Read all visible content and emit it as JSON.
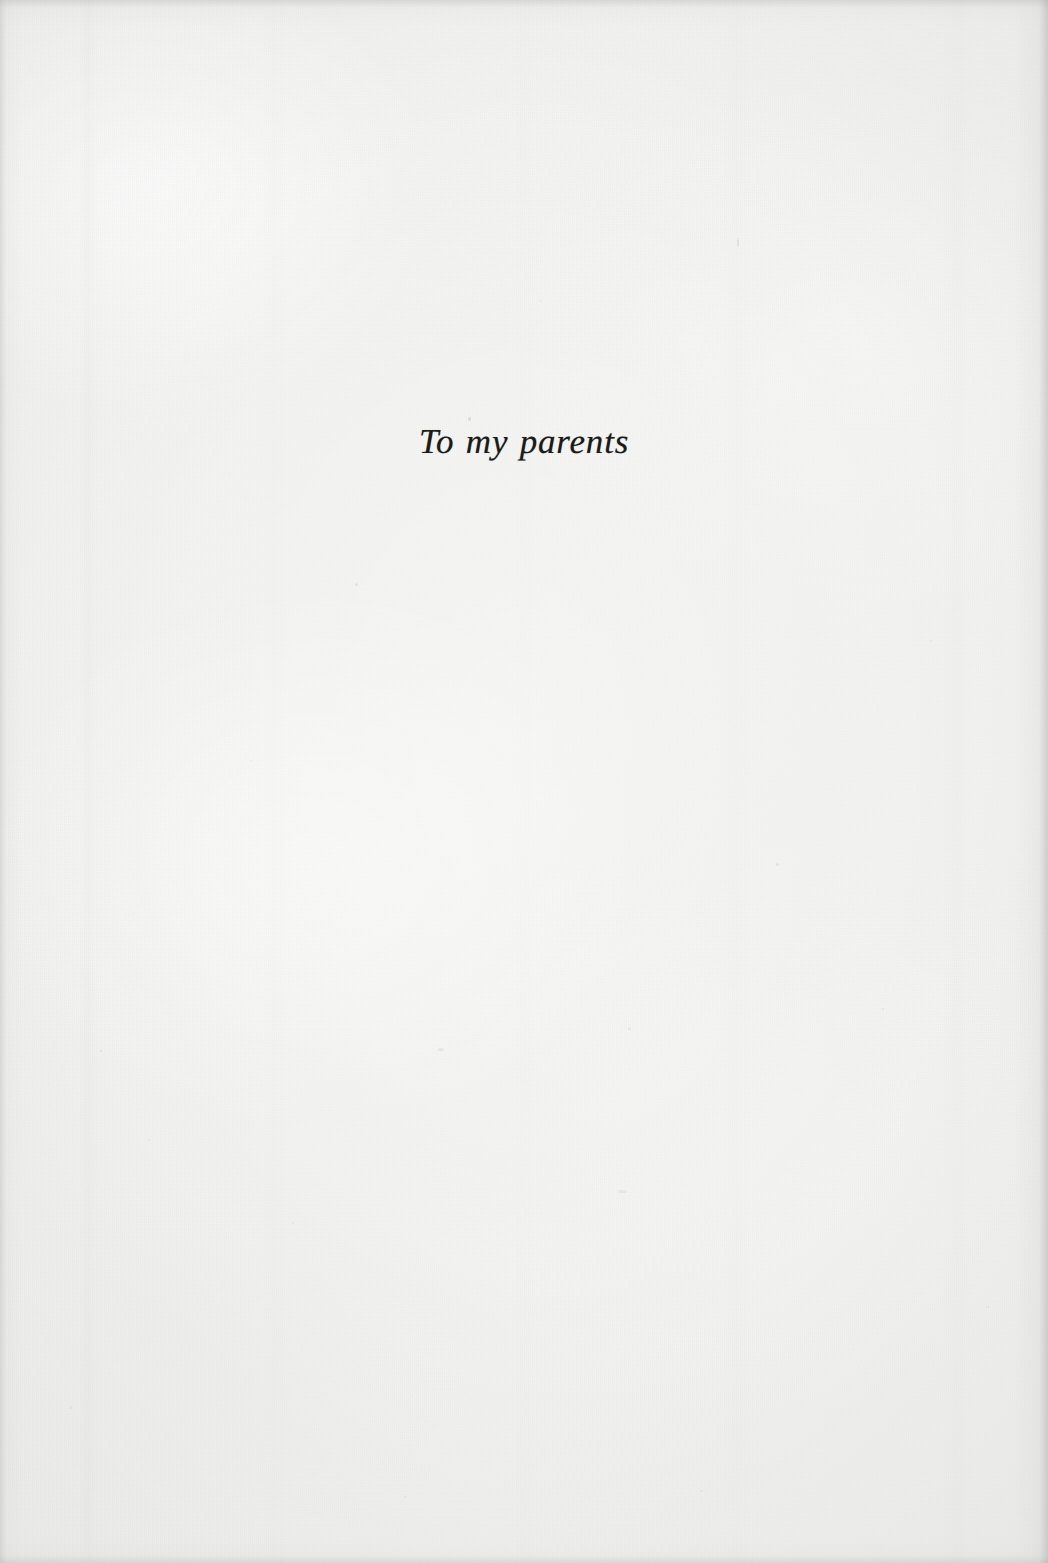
{
  "page": {
    "kind": "book-dedication-page",
    "width_px": 1048,
    "height_px": 1563,
    "paper_color": "#f3f3f1",
    "ink_color": "#1b1b19"
  },
  "dedication": {
    "text": "To my parents"
  },
  "marks": {
    "specks": [
      {
        "x": 468,
        "y": 417,
        "w": 3,
        "h": 4,
        "o": 0.42
      },
      {
        "x": 355,
        "y": 583,
        "w": 3,
        "h": 3,
        "o": 0.3
      },
      {
        "x": 737,
        "y": 238,
        "w": 2,
        "h": 9,
        "o": 0.26
      },
      {
        "x": 100,
        "y": 1050,
        "w": 2,
        "h": 2,
        "o": 0.28
      },
      {
        "x": 438,
        "y": 1048,
        "w": 6,
        "h": 3,
        "o": 0.24
      },
      {
        "x": 628,
        "y": 1028,
        "w": 3,
        "h": 2,
        "o": 0.26
      },
      {
        "x": 776,
        "y": 863,
        "w": 3,
        "h": 3,
        "o": 0.3
      },
      {
        "x": 882,
        "y": 1008,
        "w": 2,
        "h": 2,
        "o": 0.24
      },
      {
        "x": 986,
        "y": 1306,
        "w": 3,
        "h": 2,
        "o": 0.22
      },
      {
        "x": 70,
        "y": 1406,
        "w": 2,
        "h": 3,
        "o": 0.24
      },
      {
        "x": 292,
        "y": 1222,
        "w": 2,
        "h": 2,
        "o": 0.22
      },
      {
        "x": 148,
        "y": 1139,
        "w": 2,
        "h": 2,
        "o": 0.2
      },
      {
        "x": 618,
        "y": 1190,
        "w": 9,
        "h": 3,
        "o": 0.2
      },
      {
        "x": 404,
        "y": 1496,
        "w": 2,
        "h": 2,
        "o": 0.2
      },
      {
        "x": 700,
        "y": 1490,
        "w": 3,
        "h": 2,
        "o": 0.18
      },
      {
        "x": 930,
        "y": 640,
        "w": 2,
        "h": 2,
        "o": 0.22
      },
      {
        "x": 250,
        "y": 760,
        "w": 2,
        "h": 2,
        "o": 0.2
      },
      {
        "x": 540,
        "y": 300,
        "w": 2,
        "h": 2,
        "o": 0.18
      }
    ]
  }
}
